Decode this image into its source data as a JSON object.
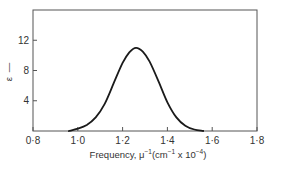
{
  "chart_data": {
    "type": "line",
    "title": "",
    "xlabel": "Frequency, μ⁻¹ (cm⁻¹ x 10⁻⁴)",
    "xlabel_parts": {
      "prefix": "Frequency, μ",
      "sup1": "−1",
      "mid": "(cm",
      "sup2": "−1",
      "mid2": " x 10",
      "sup3": "−4",
      "suffix": ")"
    },
    "ylabel": "ε",
    "ylabel_suffix": "—",
    "xlim": [
      0.8,
      1.8
    ],
    "ylim": [
      0,
      16
    ],
    "xticks": [
      {
        "value": 0.8,
        "label": "0·8"
      },
      {
        "value": 1.0,
        "label": "1·0"
      },
      {
        "value": 1.2,
        "label": "1·2"
      },
      {
        "value": 1.4,
        "label": "1·4"
      },
      {
        "value": 1.6,
        "label": "1·6"
      },
      {
        "value": 1.8,
        "label": "1·8"
      }
    ],
    "yticks": [
      {
        "value": 4,
        "label": "4"
      },
      {
        "value": 8,
        "label": "8"
      },
      {
        "value": 12,
        "label": "12"
      }
    ],
    "grid": false,
    "legend": null,
    "values_are_estimates": true,
    "estimation_note": "No data labels in figure; all points estimated from tick positions. Peak (~1.26, ~11) is the most reliable reading.",
    "series": [
      {
        "name": "absorption band",
        "x": [
          0.96,
          1.0,
          1.04,
          1.08,
          1.12,
          1.16,
          1.2,
          1.23,
          1.26,
          1.29,
          1.32,
          1.36,
          1.4,
          1.44,
          1.48,
          1.52,
          1.56
        ],
        "y": [
          0.0,
          0.3,
          0.8,
          1.8,
          3.6,
          6.3,
          9.0,
          10.4,
          11.0,
          10.5,
          9.2,
          6.6,
          3.8,
          1.8,
          0.7,
          0.2,
          0.0
        ]
      }
    ],
    "peak": {
      "x": 1.26,
      "y": 11.0
    }
  }
}
